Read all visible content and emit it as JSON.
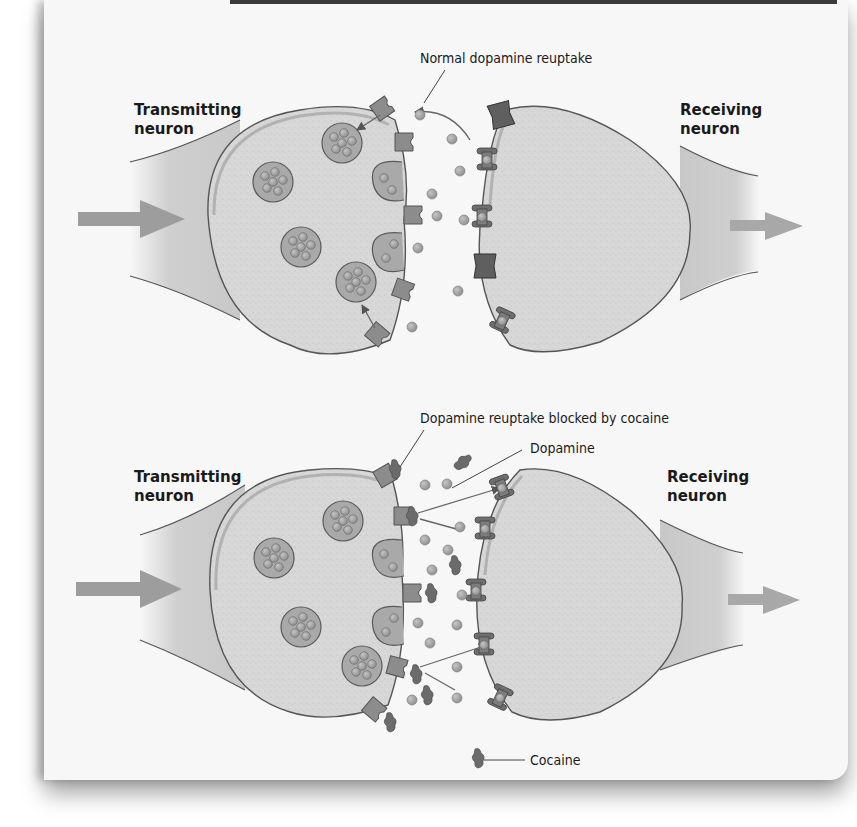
{
  "figure": {
    "top_panel": {
      "title": "Normal dopamine reuptake",
      "left_label_line1": "Transmitting",
      "left_label_line2": "neuron",
      "right_label_line1": "Receiving",
      "right_label_line2": "neuron"
    },
    "bottom_panel": {
      "title": "Dopamine reuptake blocked by cocaine",
      "dopamine_label": "Dopamine",
      "cocaine_label": "Cocaine",
      "left_label_line1": "Transmitting",
      "left_label_line2": "neuron",
      "right_label_line1": "Receiving",
      "right_label_line2": "neuron"
    }
  },
  "colors": {
    "panel_bg": "#f7f7f7",
    "cell_fill": "#d6d6d6",
    "membrane": "#8a8a8a",
    "outline": "#555555",
    "molecule": "#9a9a9a",
    "transporter": "#8c8c8c",
    "receptor": "#6e6e6e",
    "arrow": "#9d9d9d"
  }
}
